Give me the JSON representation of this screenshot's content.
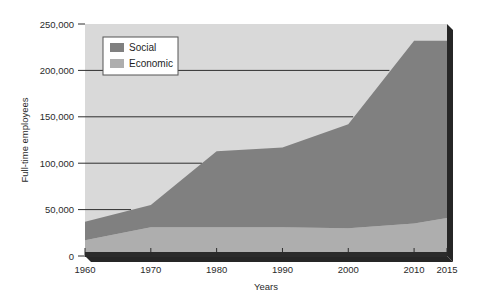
{
  "chart_data": {
    "type": "area",
    "title": "",
    "subtitle": "",
    "xlabel": "Years",
    "ylabel": "Full-time employees",
    "stacked": true,
    "grid": true,
    "grid_axis": "y",
    "legend_position": "top-left-inside",
    "x": [
      1960,
      1970,
      1980,
      1990,
      2000,
      2010,
      2015
    ],
    "categories": [
      "1960",
      "1970",
      "1980",
      "1990",
      "2000",
      "2010",
      "2015"
    ],
    "xlim": [
      1960,
      2015
    ],
    "ylim": [
      0,
      250000
    ],
    "xticks": [
      1960,
      1970,
      1980,
      1990,
      2000,
      2010,
      2015
    ],
    "xtick_labels": [
      "1960",
      "1970",
      "1980",
      "1990",
      "2000",
      "2010",
      "2015"
    ],
    "yticks": [
      0,
      50000,
      100000,
      150000,
      200000,
      250000
    ],
    "ytick_labels": [
      "0",
      "50,000",
      "100,000",
      "150,000",
      "200,000",
      "250,000"
    ],
    "series": [
      {
        "name": "Economic",
        "color": "#aeaeae",
        "values": [
          17000,
          31000,
          31000,
          31000,
          30000,
          35000,
          41000
        ]
      },
      {
        "name": "Social",
        "color": "#808080",
        "values": [
          20000,
          24000,
          82000,
          86000,
          112000,
          197000,
          191000
        ]
      }
    ],
    "series_totals": [
      37000,
      55000,
      113000,
      117000,
      142000,
      232000,
      232000
    ]
  },
  "legend": {
    "items": [
      {
        "label": "Social",
        "color": "#808080",
        "swatch": "legend-swatch-social"
      },
      {
        "label": "Economic",
        "color": "#aeaeae",
        "swatch": "legend-swatch-economic"
      }
    ]
  },
  "axes": {
    "y": {
      "title": "Full-time employees",
      "ticks": [
        "250,000",
        "200,000",
        "150,000",
        "100,000",
        "50,000",
        "0"
      ]
    },
    "x": {
      "title": "Years",
      "ticks": [
        "1960",
        "1970",
        "1980",
        "1990",
        "2000",
        "2010",
        "2015"
      ]
    }
  },
  "colors": {
    "plot_background": "#d9d9d9",
    "social": "#808080",
    "economic": "#aeaeae",
    "gridline": "#2e2e2e",
    "axis_bar": "#2b2b2b",
    "shadow": "#262626",
    "text": "#2b2b2b",
    "legend_background": "#ffffff",
    "legend_border": "#555555"
  }
}
